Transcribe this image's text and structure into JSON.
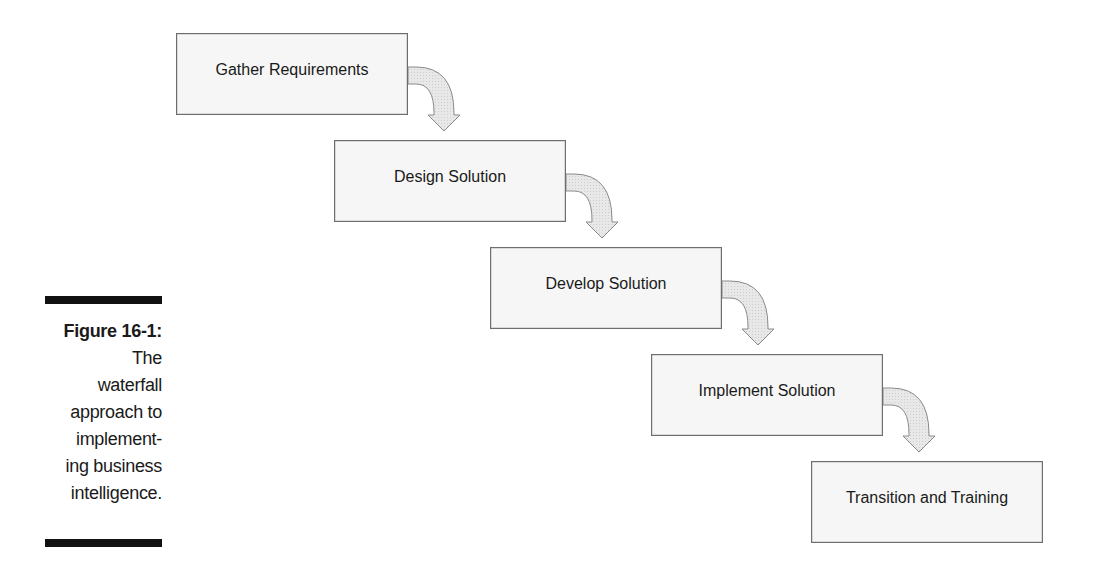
{
  "diagram": {
    "type": "waterfall-flow",
    "stages": [
      {
        "label": "Gather Requirements",
        "x": 176,
        "y": 33
      },
      {
        "label": "Design Solution",
        "x": 334,
        "y": 140
      },
      {
        "label": "Develop Solution",
        "x": 490,
        "y": 247
      },
      {
        "label": "Implement Solution",
        "x": 651,
        "y": 354
      },
      {
        "label": "Transition and Training",
        "x": 811,
        "y": 461
      }
    ],
    "colors": {
      "box_fill": "#f6f6f6",
      "box_border": "#6e6e6e",
      "arrow_fill": "#e4e4e4",
      "arrow_stroke": "#8a8a8a"
    }
  },
  "caption": {
    "figure_label": "Figure 16-1:",
    "lines": [
      "The",
      "waterfall",
      "approach to",
      "implement-",
      "ing business",
      "intelligence."
    ]
  }
}
